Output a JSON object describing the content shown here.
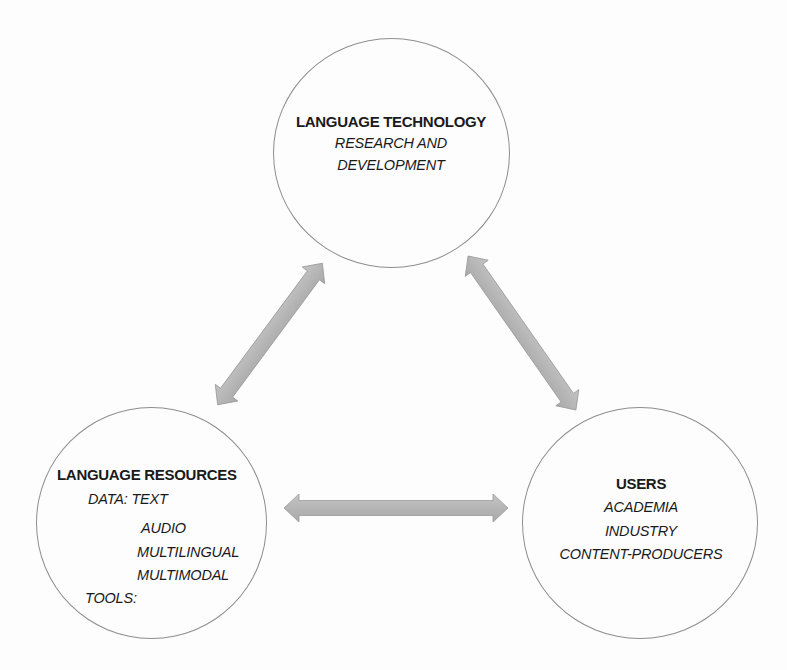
{
  "diagram": {
    "type": "triangle-relationship",
    "colors": {
      "background": "#ffffff",
      "circle_border": "#8e8e8e",
      "arrow_fill": "#b3b3b3",
      "arrow_edge": "#9a9a9a",
      "text": "#1a1a1a"
    },
    "nodes": {
      "technology": {
        "title": "LANGUAGE TECHNOLOGY",
        "lines": [
          "RESEARCH AND",
          "DEVELOPMENT"
        ]
      },
      "resources": {
        "title": "LANGUAGE RESOURCES",
        "data_label": "DATA: TEXT",
        "data_items": [
          "AUDIO",
          "MULTILINGUAL",
          "MULTIMODAL"
        ],
        "tools_label": "TOOLS:"
      },
      "users": {
        "title": "USERS",
        "lines": [
          "ACADEMIA",
          "INDUSTRY",
          "CONTENT-PRODUCERS"
        ]
      }
    },
    "edges": [
      {
        "from": "resources",
        "to": "technology",
        "type": "bidirectional"
      },
      {
        "from": "technology",
        "to": "users",
        "type": "bidirectional"
      },
      {
        "from": "resources",
        "to": "users",
        "type": "bidirectional"
      }
    ]
  }
}
